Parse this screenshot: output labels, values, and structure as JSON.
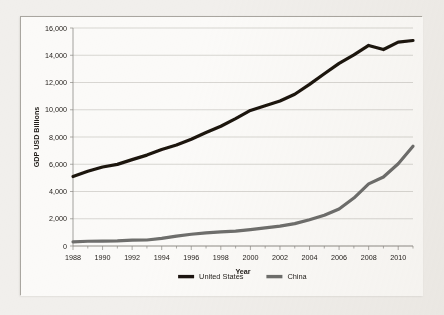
{
  "chart_data": {
    "type": "line",
    "title": "",
    "xlabel": "Year",
    "ylabel": "GDP USD Billions",
    "xlim": [
      1988,
      2011
    ],
    "ylim": [
      0,
      16000
    ],
    "ytick_step": 2000,
    "xtick_step": 2,
    "grid": true,
    "legend_position": "bottom",
    "ytick_labels": [
      "0",
      "2,000",
      "4,000",
      "6,000",
      "8,000",
      "10,000",
      "12,000",
      "14,000",
      "16,000"
    ],
    "ytick_values": [
      0,
      2000,
      4000,
      6000,
      8000,
      10000,
      12000,
      14000,
      16000
    ],
    "xtick_labels": [
      "1988",
      "1990",
      "1992",
      "1994",
      "1996",
      "1998",
      "2000",
      "2002",
      "2004",
      "2006",
      "2008",
      "2010"
    ],
    "xtick_values": [
      1988,
      1990,
      1992,
      1994,
      1996,
      1998,
      2000,
      2002,
      2004,
      2006,
      2008,
      2010
    ],
    "x": [
      1988,
      1989,
      1990,
      1991,
      1992,
      1993,
      1994,
      1995,
      1996,
      1997,
      1998,
      1999,
      2000,
      2001,
      2002,
      2003,
      2004,
      2005,
      2006,
      2007,
      2008,
      2009,
      2010,
      2011
    ],
    "series": [
      {
        "name": "United States",
        "color": "#1c1410",
        "values": [
          5100,
          5480,
          5800,
          5990,
          6340,
          6670,
          7080,
          7410,
          7840,
          8330,
          8790,
          9350,
          9950,
          10290,
          10640,
          11140,
          11860,
          12640,
          13400,
          14030,
          14720,
          14420,
          14960,
          15080
        ]
      },
      {
        "name": "China",
        "color": "#6e6e6c",
        "values": [
          310,
          350,
          360,
          380,
          425,
          440,
          560,
          730,
          860,
          960,
          1030,
          1090,
          1200,
          1330,
          1460,
          1640,
          1930,
          2260,
          2720,
          3520,
          4560,
          5060,
          6040,
          7320
        ]
      }
    ]
  },
  "legend": {
    "items": [
      {
        "label": "United States",
        "color": "#1c1410"
      },
      {
        "label": "China",
        "color": "#6e6e6c"
      }
    ]
  }
}
